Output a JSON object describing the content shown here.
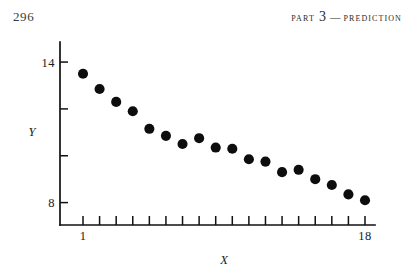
{
  "page": {
    "folio": "296",
    "running_head": {
      "part_word": "PART",
      "part_number": "3",
      "dash": "—",
      "section": "PREDICTION"
    }
  },
  "chart_data": {
    "type": "scatter",
    "title": "",
    "subtitle": "",
    "xlabel": "X",
    "ylabel": "Y",
    "xlim": [
      1,
      18
    ],
    "ylim": [
      7.3,
      14.6
    ],
    "grid": false,
    "legend": null,
    "x_tick_values": [
      1,
      2,
      3,
      4,
      5,
      6,
      7,
      8,
      9,
      10,
      11,
      12,
      13,
      14,
      15,
      16,
      17,
      18
    ],
    "x_tick_labels": [
      "1",
      "",
      "",
      "",
      "",
      "",
      "",
      "",
      "",
      "",
      "",
      "",
      "",
      "",
      "",
      "",
      "",
      "18"
    ],
    "y_tick_values": [
      8,
      10,
      12,
      14
    ],
    "y_tick_labels": [
      "8",
      "",
      "",
      "14"
    ],
    "x": [
      1,
      2,
      3,
      4,
      5,
      6,
      7,
      8,
      9,
      10,
      11,
      12,
      13,
      14,
      15,
      16,
      17,
      18
    ],
    "values": [
      13.5,
      12.85,
      12.3,
      11.9,
      11.15,
      10.85,
      10.5,
      10.75,
      10.35,
      10.3,
      9.85,
      9.75,
      9.3,
      9.4,
      9.0,
      8.75,
      8.35,
      8.1
    ],
    "marker": "filled-circle",
    "marker_color": "#0d0d0d",
    "marker_size_px": 5.1,
    "n_points": 18
  },
  "figure": {
    "axis_color": "#111111"
  }
}
